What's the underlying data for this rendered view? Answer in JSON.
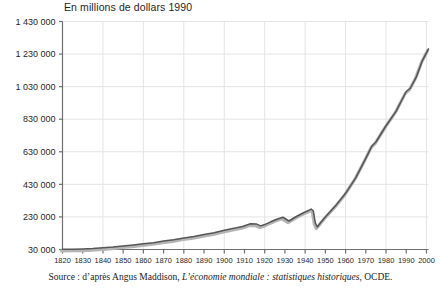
{
  "chart_title": "En millions de dollars 1990",
  "source_note": {
    "prefix": "Source : d’après Angus Maddison, ",
    "italic": "L’économie mondiale : statistiques historiques",
    "suffix": ", OCDE."
  },
  "colors": {
    "line": "#565656",
    "shadow": "#b4b4b4",
    "grid": "#e4e4e4",
    "axis": "#6e6e6e",
    "text": "#1f1f1f"
  },
  "chart_data": {
    "type": "line",
    "title": "En millions de dollars 1990",
    "xlabel": "",
    "ylabel": "En millions de dollars 1990",
    "xlim": [
      1820,
      2001
    ],
    "ylim": [
      30000,
      1430000
    ],
    "grid": true,
    "legend": false,
    "ytick_labels": [
      "1 430 000",
      "1 230 000",
      "1 030 000",
      "830 000",
      "630 000",
      "430 000",
      "230 000",
      "30 000"
    ],
    "ytick_values": [
      1430000,
      1230000,
      1030000,
      830000,
      630000,
      430000,
      230000,
      30000
    ],
    "xtick_labels": [
      "1820",
      "1830",
      "1840",
      "1850",
      "1860",
      "1870",
      "1880",
      "1890",
      "1900",
      "1910",
      "1920",
      "1930",
      "1940",
      "1950",
      "1960",
      "1970",
      "1980",
      "1990",
      "2000"
    ],
    "xtick_values": [
      1820,
      1830,
      1840,
      1850,
      1860,
      1870,
      1880,
      1890,
      1900,
      1910,
      1920,
      1930,
      1940,
      1950,
      1960,
      1970,
      1980,
      1990,
      2000
    ],
    "xgrid_values": [
      1840,
      1860,
      1880,
      1900,
      1920,
      1940,
      1960,
      1980,
      2000
    ],
    "series": [
      {
        "name": "PIB mondial",
        "x": [
          1820,
          1825,
          1830,
          1835,
          1840,
          1845,
          1850,
          1855,
          1860,
          1865,
          1870,
          1875,
          1880,
          1885,
          1890,
          1895,
          1900,
          1903,
          1906,
          1909,
          1913,
          1916,
          1918,
          1920,
          1923,
          1926,
          1929,
          1932,
          1935,
          1938,
          1940,
          1942,
          1943,
          1944,
          1945,
          1946,
          1948,
          1950,
          1955,
          1960,
          1965,
          1970,
          1973,
          1975,
          1980,
          1985,
          1990,
          1992,
          1995,
          1998,
          2001
        ],
        "values": [
          31000,
          32000,
          33500,
          36000,
          40000,
          45000,
          52000,
          58000,
          65000,
          72000,
          82000,
          90000,
          101000,
          110000,
          122000,
          133000,
          148000,
          156000,
          163000,
          171000,
          188000,
          186000,
          175000,
          183000,
          200000,
          216000,
          228000,
          205000,
          228000,
          248000,
          260000,
          272000,
          278000,
          268000,
          195000,
          168000,
          200000,
          230000,
          298000,
          375000,
          470000,
          590000,
          665000,
          690000,
          790000,
          880000,
          1000000,
          1020000,
          1090000,
          1190000,
          1262000
        ]
      }
    ]
  }
}
